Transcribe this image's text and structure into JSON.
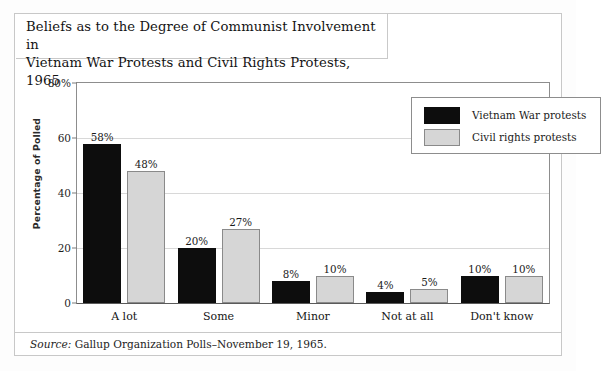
{
  "figure": {
    "title": "Beliefs as to the Degree of Communist Involvement in\nVietnam War Protests and Civil Rights Protests, 1965",
    "source_label": "Source:",
    "source_text": " Gallup Organization Polls–November 19, 1965."
  },
  "colors": {
    "series_a": "#0d0d0d",
    "series_b": "#d6d6d6",
    "series_b_border": "#8a8a8a",
    "gridline": "#d8d8d8",
    "axis": "#8d8d8d",
    "frame": "#c8c8c8",
    "background": "#ffffff"
  },
  "legend": {
    "position": "top-right",
    "entries": [
      {
        "label": "Vietnam War protests",
        "swatch": "series-a"
      },
      {
        "label": "Civil rights protests",
        "swatch": "series-b"
      }
    ]
  },
  "chart_data": {
    "type": "bar",
    "title": "Beliefs as to the Degree of Communist Involvement in Vietnam War Protests and Civil Rights Protests, 1965",
    "xlabel": "",
    "ylabel": "Percentage of Polled",
    "ylim": [
      0,
      80
    ],
    "yticks": [
      0,
      20,
      40,
      60,
      80
    ],
    "ytick_labels": [
      "0",
      "20",
      "40",
      "60",
      "80%"
    ],
    "grid": true,
    "categories": [
      "A lot",
      "Some",
      "Minor",
      "Not at all",
      "Don't know"
    ],
    "series": [
      {
        "name": "Vietnam War protests",
        "values": [
          58,
          20,
          8,
          4,
          10
        ],
        "labels": [
          "58%",
          "20%",
          "8%",
          "4%",
          "10%"
        ]
      },
      {
        "name": "Civil rights protests",
        "values": [
          48,
          27,
          10,
          5,
          10
        ],
        "labels": [
          "48%",
          "27%",
          "10%",
          "5%",
          "10%"
        ]
      }
    ],
    "annotations": [
      "Source: Gallup Organization Polls–November 19, 1965."
    ]
  }
}
